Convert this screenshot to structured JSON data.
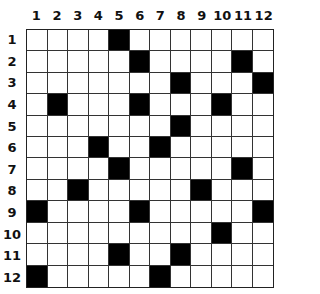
{
  "puzzle": {
    "rows": 12,
    "cols": 12,
    "column_labels": [
      "1",
      "2",
      "3",
      "4",
      "5",
      "6",
      "7",
      "8",
      "9",
      "10",
      "11",
      "12"
    ],
    "row_labels": [
      "1",
      "2",
      "3",
      "4",
      "5",
      "6",
      "7",
      "8",
      "9",
      "10",
      "11",
      "12"
    ],
    "black_cells": {
      "1": [
        5
      ],
      "2": [
        6,
        11
      ],
      "3": [
        8,
        12
      ],
      "4": [
        2,
        6,
        10
      ],
      "5": [
        8
      ],
      "6": [
        4,
        7
      ],
      "7": [
        5,
        11
      ],
      "8": [
        3,
        9
      ],
      "9": [
        1,
        6,
        12
      ],
      "10": [
        10
      ],
      "11": [
        5,
        8
      ],
      "12": [
        1,
        7
      ]
    },
    "colors": {
      "black": "#000000",
      "white": "#ffffff",
      "line": "#333333"
    }
  }
}
